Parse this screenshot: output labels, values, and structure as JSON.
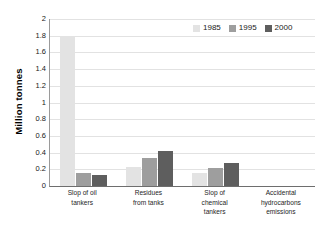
{
  "chart_data": {
    "type": "bar",
    "title": "",
    "xlabel": "",
    "ylabel": "Million tonnes",
    "ylim": [
      0,
      2
    ],
    "ytick_labels": [
      "2",
      "1.8",
      "1.6",
      "1.4",
      "1.2",
      "1",
      "0.8",
      "0.6",
      "0.4",
      "0.2",
      "0"
    ],
    "ytick_values": [
      2,
      1.8,
      1.6,
      1.4,
      1.2,
      1,
      0.8,
      0.6,
      0.4,
      0.2,
      0
    ],
    "grid": true,
    "legend_position": "top-right",
    "categories": [
      "Slop of oil tankers",
      "Residues from tanks",
      "Slop of chemical tankers",
      "Accidental hydrocarbons emissions"
    ],
    "category_lines": [
      [
        "Slop of oil",
        "tankers"
      ],
      [
        "Residues",
        "from tanks"
      ],
      [
        "Slop of",
        "chemical",
        "tankers"
      ],
      [
        "Accidental",
        "hydrocarbons",
        "emissions"
      ]
    ],
    "series": [
      {
        "name": "1985",
        "color": "#e3e3e3",
        "values": [
          1.8,
          0.23,
          0.15,
          0.0
        ]
      },
      {
        "name": "1995",
        "color": "#9e9e9e",
        "values": [
          0.15,
          0.33,
          0.21,
          0.0
        ]
      },
      {
        "name": "2000",
        "color": "#5e5e5e",
        "values": [
          0.13,
          0.42,
          0.27,
          0.0
        ]
      }
    ]
  },
  "legend": {
    "items": [
      {
        "label": "1985"
      },
      {
        "label": "1995"
      },
      {
        "label": "2000"
      }
    ]
  }
}
